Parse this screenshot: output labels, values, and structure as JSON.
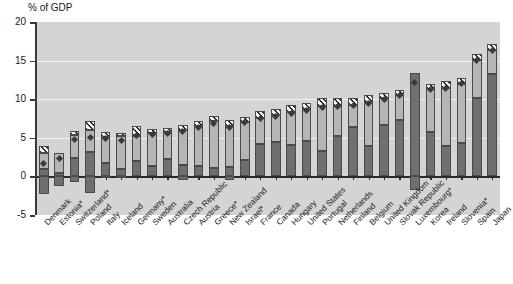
{
  "chart_data": {
    "type": "bar",
    "subtype": "stacked-bar-with-marker",
    "title": "",
    "ylabel": "% of GDP",
    "xlabel": "",
    "ylim": [
      -5,
      20
    ],
    "yticks": [
      -5,
      0,
      5,
      10,
      15,
      20
    ],
    "ytick_labels": [
      "-5",
      "0",
      "5",
      "10",
      "15",
      "20"
    ],
    "grid": true,
    "gridlines_at": [
      5,
      10,
      15
    ],
    "legend": "none",
    "categories": [
      "Denmark",
      "Estonia*",
      "Switzerland*",
      "Poland",
      "Italy",
      "Iceland",
      "Germany*",
      "Sweden",
      "Australia",
      "Czech Republic",
      "Austria",
      "Greece*",
      "New Zealand",
      "Israel*",
      "France",
      "Canada",
      "Hungary",
      "United States",
      "Portugal",
      "Netherlands",
      "Finland",
      "Belgium",
      "United Kingdom",
      "Slovak Republic",
      "Luxembourg*",
      "Korea",
      "Ireland",
      "Slovenia*",
      "Spain",
      "Japan"
    ],
    "series": [
      {
        "name": "negative-segment",
        "values": [
          -2.3,
          -1.3,
          -0.7,
          -2.2,
          -0.2,
          -0.1,
          0,
          0,
          0,
          -0.5,
          0,
          0,
          -0.5,
          0,
          0,
          0,
          0,
          0,
          0,
          0,
          0,
          0,
          0,
          0,
          -1.8,
          0,
          0,
          0,
          0,
          0
        ]
      },
      {
        "name": "dark-segment",
        "values": [
          1.0,
          0.4,
          2.4,
          3.1,
          1.7,
          0.9,
          2.0,
          1.3,
          2.2,
          1.5,
          1.4,
          1.1,
          1.2,
          2.1,
          4.2,
          4.4,
          4.1,
          4.6,
          3.3,
          5.2,
          6.4,
          4.0,
          6.6,
          7.3,
          13.4,
          5.7,
          4.0,
          4.3,
          10.1,
          13.3
        ]
      },
      {
        "name": "light-segment",
        "values": [
          2.0,
          2.6,
          3.0,
          2.9,
          3.4,
          4.3,
          3.2,
          4.3,
          3.6,
          4.5,
          5.1,
          6.1,
          5.3,
          5.0,
          3.4,
          3.5,
          4.3,
          4.1,
          5.8,
          3.9,
          2.9,
          5.7,
          3.5,
          3.3,
          0.0,
          5.6,
          7.5,
          7.7,
          5.0,
          3.1
        ]
      },
      {
        "name": "hatched-segment",
        "values": [
          1.0,
          0.0,
          0.5,
          1.2,
          0.7,
          0.4,
          1.3,
          0.5,
          0.5,
          0.7,
          0.7,
          0.6,
          0.8,
          0.6,
          0.9,
          0.8,
          0.9,
          0.8,
          1.0,
          1.0,
          0.8,
          0.8,
          0.7,
          0.6,
          0.0,
          0.7,
          0.8,
          0.8,
          0.8,
          0.8
        ]
      }
    ],
    "markers": {
      "name": "diamond-marker",
      "values": [
        1.7,
        2.3,
        4.8,
        5.1,
        4.9,
        4.6,
        5.3,
        5.4,
        5.6,
        5.8,
        6.3,
        6.9,
        6.3,
        7.0,
        7.5,
        7.8,
        8.2,
        8.5,
        8.9,
        9.0,
        9.2,
        9.5,
        10.0,
        10.5,
        12.1,
        11.2,
        11.4,
        12.0,
        15.0,
        16.3
      ]
    }
  },
  "axis": {
    "y_title": "% of GDP"
  }
}
